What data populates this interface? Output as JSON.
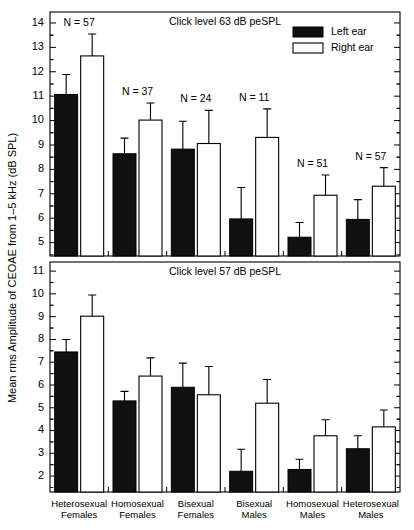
{
  "figure": {
    "ylabel": "Mean rms Amplitude of CEOAE from 1–5 kHz (dB SPL)",
    "legend": {
      "left_label": "Left ear",
      "right_label": "Right ear",
      "left_color": "#101010",
      "right_color": "#ffffff"
    },
    "categories": [
      {
        "line1": "Heterosexual",
        "line2": "Females"
      },
      {
        "line1": "Homosexual",
        "line2": "Females"
      },
      {
        "line1": "Bisexual",
        "line2": "Females"
      },
      {
        "line1": "Bisexual",
        "line2": "Males"
      },
      {
        "line1": "Homosexual",
        "line2": "Males"
      },
      {
        "line1": "Heterosexual",
        "line2": "Males"
      }
    ]
  },
  "chart_data": [
    {
      "type": "bar",
      "title": "Click level 63 dB peSPL",
      "panel": "top",
      "xlabel": "",
      "ylabel": "Mean rms Amplitude of CEOAE from 1–5 kHz (dB SPL)",
      "ylim": [
        4.45,
        14.45
      ],
      "yticks": [
        5,
        6,
        7,
        8,
        9,
        10,
        11,
        12,
        13,
        14
      ],
      "grid": false,
      "legend_position": "top-right",
      "categories": [
        "Heterosexual Females",
        "Homosexual Females",
        "Bisexual Females",
        "Bisexual Males",
        "Homosexual Males",
        "Heterosexual Males"
      ],
      "n_labels": [
        "N = 57",
        "N = 37",
        "N = 24",
        "N = 11",
        "N = 51",
        "N = 57"
      ],
      "n_values": [
        57,
        37,
        24,
        11,
        51,
        57
      ],
      "series": [
        {
          "name": "Left ear",
          "color": "#101010",
          "values": [
            11.07,
            8.64,
            8.83,
            5.97,
            5.22,
            5.95
          ],
          "errors": [
            0.82,
            0.64,
            1.14,
            1.29,
            0.6,
            0.81
          ]
        },
        {
          "name": "Right ear",
          "color": "#ffffff",
          "values": [
            12.65,
            10.02,
            9.06,
            9.31,
            6.94,
            7.31
          ],
          "errors": [
            0.9,
            0.7,
            1.36,
            1.17,
            0.83,
            0.76
          ]
        }
      ]
    },
    {
      "type": "bar",
      "title": "Click level 57 dB peSPL",
      "panel": "bottom",
      "xlabel": "",
      "ylabel": "Mean rms Amplitude of CEOAE from 1–5 kHz (dB SPL)",
      "ylim": [
        1.3,
        11.4
      ],
      "yticks": [
        2,
        3,
        4,
        5,
        6,
        7,
        8,
        9,
        10,
        11
      ],
      "grid": false,
      "legend_position": "none",
      "categories": [
        "Heterosexual Females",
        "Homosexual Females",
        "Bisexual Females",
        "Bisexual Males",
        "Homosexual Males",
        "Heterosexual Males"
      ],
      "series": [
        {
          "name": "Left ear",
          "color": "#101010",
          "values": [
            7.45,
            5.3,
            5.9,
            2.21,
            2.29,
            3.2
          ],
          "errors": [
            0.55,
            0.42,
            1.06,
            0.97,
            0.45,
            0.57
          ]
        },
        {
          "name": "Right ear",
          "color": "#ffffff",
          "values": [
            9.02,
            6.39,
            5.57,
            5.2,
            3.77,
            4.16
          ],
          "errors": [
            0.93,
            0.8,
            1.24,
            1.04,
            0.7,
            0.74
          ]
        }
      ]
    }
  ]
}
